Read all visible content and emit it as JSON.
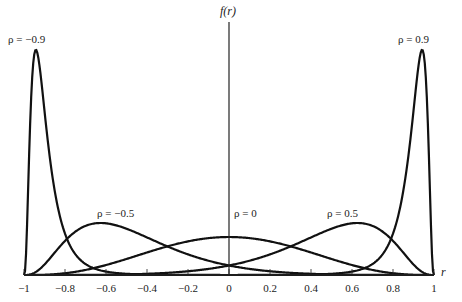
{
  "chart_data": {
    "type": "line",
    "title": "",
    "xlabel": "r",
    "ylabel": "f(r)",
    "xlim": [
      -1,
      1
    ],
    "grid": false,
    "legend_position": "inline-annotations",
    "x_ticks": [
      -1,
      -0.8,
      -0.6,
      -0.4,
      -0.2,
      0,
      0.2,
      0.4,
      0.6,
      0.8,
      1
    ],
    "x_tick_labels": [
      "−1",
      "−0.8",
      "−0.6",
      "−0.4",
      "−0.2",
      "0",
      "0.2",
      "0.4",
      "0.6",
      "0.8",
      "1"
    ],
    "series": [
      {
        "name": "ρ = −0.9",
        "rho": -0.9,
        "label": "ρ = −0.9"
      },
      {
        "name": "ρ = −0.5",
        "rho": -0.5,
        "label": "ρ = −0.5"
      },
      {
        "name": "ρ = 0",
        "rho": 0,
        "label": "ρ = 0"
      },
      {
        "name": "ρ = 0.5",
        "rho": 0.5,
        "label": "ρ = 0.5"
      },
      {
        "name": "ρ = 0.9",
        "rho": 0.9,
        "label": "ρ = 0.9"
      }
    ],
    "annotations": [
      "ρ = −0.9",
      "ρ = −0.5",
      "ρ = 0",
      "ρ = 0.5",
      "ρ = 0.9"
    ],
    "sample_size_n": 10
  },
  "labels": {
    "y_axis": "f(r)",
    "x_axis": "r"
  }
}
